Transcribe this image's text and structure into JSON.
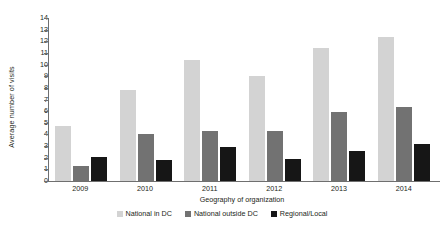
{
  "chart_data": {
    "type": "bar",
    "title": "",
    "xlabel": "Geography of organization",
    "ylabel": "Average number of visits",
    "categories": [
      "2009",
      "2010",
      "2011",
      "2012",
      "2013",
      "2014"
    ],
    "series": [
      {
        "name": "National in DC",
        "color": "#d3d3d3",
        "values": [
          4.7,
          7.8,
          10.4,
          9.0,
          11.4,
          12.35
        ]
      },
      {
        "name": "National outside DC",
        "color": "#727272",
        "values": [
          1.3,
          4.05,
          4.3,
          4.3,
          5.95,
          6.4
        ]
      },
      {
        "name": "Regional/Local",
        "color": "#161616",
        "values": [
          2.05,
          1.8,
          2.9,
          1.9,
          2.6,
          3.15
        ]
      }
    ],
    "ylim": [
      0,
      14
    ],
    "ytick_step": 1,
    "yticks": [
      "14",
      "13",
      "12",
      "11",
      "10",
      "9",
      "8",
      "7",
      "6",
      "5",
      "4",
      "3",
      "2",
      "1",
      "0"
    ],
    "grid": false,
    "legend_position": "bottom"
  }
}
